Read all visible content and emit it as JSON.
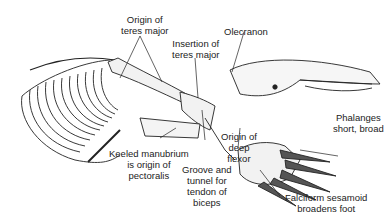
{
  "diagram": {
    "labels": {
      "origin_teres_major": [
        "Origin of",
        "teres major"
      ],
      "insertion_teres_major": [
        "Insertion of",
        "teres major"
      ],
      "olecranon": [
        "Olecranon"
      ],
      "keeled_manubrium": [
        "Keeled manubrium",
        "is origin of",
        "pectoralis"
      ],
      "groove_tunnel": [
        "Groove and",
        "tunnel for",
        "tendon of",
        "biceps"
      ],
      "origin_deep_flexor": [
        "Origin of",
        "deep",
        "flexor"
      ],
      "phalanges": [
        "Phalanges",
        "short, broad"
      ],
      "falciform": [
        "Falciform sesamoid",
        "broadens foot"
      ]
    }
  }
}
